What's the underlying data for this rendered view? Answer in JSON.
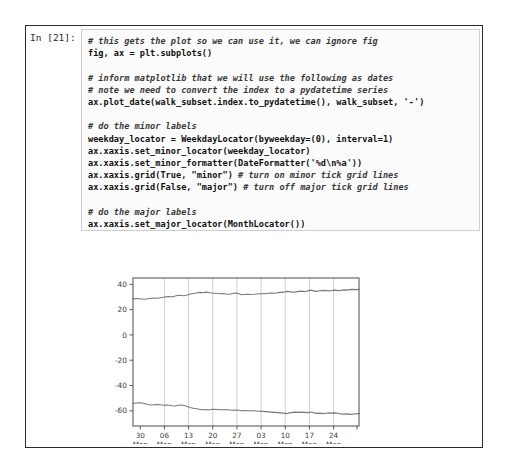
{
  "notebook": {
    "prompt_label": "In [21]:",
    "code_lines": [
      {
        "t": "comment",
        "text": "# this gets the plot so we can use it, we can ignore fig"
      },
      {
        "t": "code",
        "text": "fig, ax = plt.subplots()"
      },
      {
        "t": "blank",
        "text": ""
      },
      {
        "t": "comment",
        "text": "# inform matplotlib that we will use the following as dates"
      },
      {
        "t": "comment",
        "text": "# note we need to convert the index to a pydatetime series"
      },
      {
        "t": "code",
        "text": "ax.plot_date(walk_subset.index.to_pydatetime(), walk_subset, '-')"
      },
      {
        "t": "blank",
        "text": ""
      },
      {
        "t": "comment",
        "text": "# do the minor labels"
      },
      {
        "t": "code",
        "text": "weekday_locator = WeekdayLocator(byweekday=(0), interval=1)"
      },
      {
        "t": "code",
        "text": "ax.xaxis.set_minor_locator(weekday_locator)"
      },
      {
        "t": "code",
        "text": "ax.xaxis.set_minor_formatter(DateFormatter('%d\\n%a'))"
      },
      {
        "t": "mixed",
        "text": "ax.xaxis.grid(True, \"minor\") ",
        "comment": "# turn on minor tick grid lines"
      },
      {
        "t": "mixed",
        "text": "ax.xaxis.grid(False, \"major\") ",
        "comment": "# turn off major tick grid lines"
      },
      {
        "t": "blank",
        "text": ""
      },
      {
        "t": "comment",
        "text": "# do the major labels"
      },
      {
        "t": "code",
        "text": "ax.xaxis.set_major_locator(MonthLocator())"
      },
      {
        "t": "code",
        "text": "ax.xaxis.set_major_formatter(DateFormatter('\\n\\n\\n%b\\n%Y'));"
      }
    ],
    "code_plain": "# this gets the plot so we can use it, we can ignore fig\nfig, ax = plt.subplots()\n\n# inform matplotlib that we will use the following as dates\n# note we need to convert the index to a pydatetime series\nax.plot_date(walk_subset.index.to_pydatetime(), walk_subset, '-')\n\n# do the minor labels\nweekday_locator = WeekdayLocator(byweekday=(0), interval=1)\nax.xaxis.set_minor_locator(weekday_locator)\nax.xaxis.set_minor_formatter(DateFormatter('%d\\n%a'))\nax.xaxis.grid(True, \"minor\") # turn on minor tick grid lines\nax.xaxis.grid(False, \"major\") # turn off major tick grid lines\n\n# do the major labels\nax.xaxis.set_major_locator(MonthLocator())\nax.xaxis.set_major_formatter(DateFormatter('\\n\\n\\n%b\\n%Y'));"
  },
  "colors": {
    "line": "#7a7a7a",
    "grid": "#b9b9c4",
    "axis": "#4a4a4a",
    "frame": "#2b2b2b",
    "code_bg": "#fbfbfb",
    "code_border": "#cfcfcf"
  },
  "chart_data": {
    "type": "line",
    "title": "",
    "xlabel": "",
    "ylabel": "",
    "grid": "minor-vertical-only",
    "legend": "none",
    "ylim": [
      -72,
      45
    ],
    "yticks": [
      40,
      20,
      0,
      -20,
      -40,
      -60
    ],
    "ytick_labels": [
      "40",
      "20",
      "0",
      "-20",
      "-40",
      "-60"
    ],
    "xlim": [
      "2013-12-30",
      "2014-03-02"
    ],
    "x_minor_ticks": [
      {
        "day": "30",
        "weekday": "Mon",
        "date": "2013-12-30"
      },
      {
        "day": "06",
        "weekday": "Mon",
        "date": "2014-01-06"
      },
      {
        "day": "13",
        "weekday": "Mon",
        "date": "2014-01-13"
      },
      {
        "day": "20",
        "weekday": "Mon",
        "date": "2014-01-20"
      },
      {
        "day": "27",
        "weekday": "Mon",
        "date": "2014-01-27"
      },
      {
        "day": "03",
        "weekday": "Mon",
        "date": "2014-02-03"
      },
      {
        "day": "10",
        "weekday": "Mon",
        "date": "2014-02-10"
      },
      {
        "day": "17",
        "weekday": "Mon",
        "date": "2014-02-17"
      },
      {
        "day": "24",
        "weekday": "Mon",
        "date": "2014-02-24"
      }
    ],
    "x_major_ticks": [
      {
        "month": "Jan",
        "year": "2014",
        "date": "2014-01-01"
      },
      {
        "month": "Feb",
        "year": "2014",
        "date": "2014-02-01"
      },
      {
        "month": "Mar",
        "year": "2014",
        "date": "2014-03-01"
      }
    ],
    "series": [
      {
        "name": "walk_subset_1",
        "values": [
          28.5,
          28.8,
          28.6,
          28.4,
          28.2,
          28.6,
          29.0,
          29.2,
          29.0,
          29.4,
          29.8,
          30.1,
          30.4,
          30.0,
          30.8,
          31.4,
          31.2,
          31.0,
          31.6,
          32.3,
          32.8,
          33.2,
          33.6,
          33.4,
          33.8,
          33.6,
          33.2,
          33.0,
          32.8,
          32.6,
          32.7,
          32.4,
          32.2,
          32.8,
          33.2,
          32.8,
          31.8,
          32.0,
          32.2,
          32.0,
          32.1,
          32.3,
          32.6,
          32.5,
          32.8,
          33.0,
          33.2,
          33.0,
          33.4,
          33.6,
          33.8,
          34.4,
          34.2,
          33.8,
          34.0,
          34.4,
          34.6,
          34.2,
          34.8,
          35.4,
          34.8,
          34.4,
          34.9,
          35.2,
          35.0,
          34.8,
          35.1,
          35.4,
          35.0,
          35.2,
          35.6,
          35.4,
          35.8,
          36.0,
          35.8,
          36.0
        ]
      },
      {
        "name": "walk_subset_2",
        "values": [
          -54.2,
          -53.8,
          -53.6,
          -53.8,
          -54.4,
          -55.0,
          -55.4,
          -55.2,
          -55.0,
          -55.2,
          -55.6,
          -55.4,
          -55.6,
          -56.0,
          -56.2,
          -55.6,
          -55.4,
          -55.8,
          -56.6,
          -57.4,
          -58.0,
          -58.4,
          -58.8,
          -59.2,
          -59.0,
          -59.3,
          -59.0,
          -58.8,
          -59.0,
          -59.2,
          -59.1,
          -59.0,
          -59.3,
          -59.6,
          -59.4,
          -59.6,
          -60.0,
          -59.8,
          -59.9,
          -60.0,
          -59.9,
          -60.1,
          -60.3,
          -60.4,
          -60.6,
          -60.8,
          -61.0,
          -61.2,
          -61.4,
          -61.6,
          -61.8,
          -62.2,
          -61.6,
          -61.2,
          -61.0,
          -61.2,
          -61.0,
          -61.2,
          -61.4,
          -61.0,
          -61.6,
          -62.0,
          -61.8,
          -62.2,
          -61.9,
          -61.6,
          -61.8,
          -61.6,
          -61.9,
          -62.4,
          -62.6,
          -62.4,
          -62.8,
          -62.6,
          -62.3,
          -62.2
        ]
      }
    ]
  }
}
